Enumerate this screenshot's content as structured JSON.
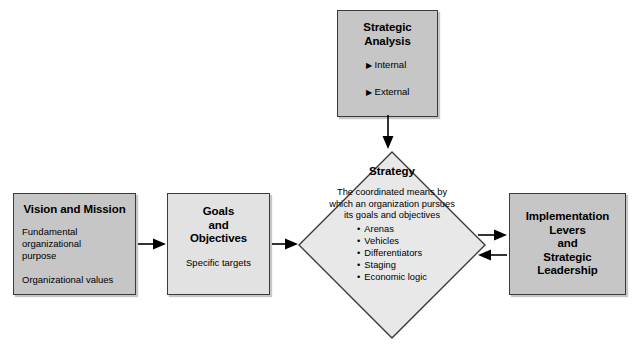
{
  "diagram": {
    "colors": {
      "box_dark": "#c6c6c6",
      "box_light": "#e2e2e2",
      "diamond_fill": "#e8e8e8",
      "border": "#3a3a3a",
      "text": "#000000",
      "background": "#ffffff"
    },
    "nodes": {
      "strategic_analysis": {
        "title_line1": "Strategic",
        "title_line2": "Analysis",
        "bullets": [
          "Internal",
          "External"
        ],
        "bullet_marker": "triangle-right-icon"
      },
      "vision_mission": {
        "title": "Vision and Mission",
        "line1": "Fundamental",
        "line2": "organizational",
        "line3": "purpose",
        "line4": "Organizational values"
      },
      "goals_objectives": {
        "title_line1": "Goals",
        "title_line2": "and",
        "title_line3": "Objectives",
        "subtitle": "Specific targets"
      },
      "strategy": {
        "title": "Strategy",
        "desc_line1": "The coordinated means by",
        "desc_line2": "which an organization pursues",
        "desc_line3": "its goals and objectives",
        "items": [
          "Arenas",
          "Vehicles",
          "Differentiators",
          "Staging",
          "Economic logic"
        ]
      },
      "implementation": {
        "line1": "Implementation",
        "line2": "Levers",
        "line3": "and",
        "line4": "Strategic",
        "line5": "Leadership"
      }
    },
    "connectors": [
      {
        "name": "analysis-to-strategy",
        "direction": "down"
      },
      {
        "name": "vision-to-goals",
        "direction": "right"
      },
      {
        "name": "goals-to-strategy",
        "direction": "right"
      },
      {
        "name": "strategy-to-implementation",
        "direction": "right"
      },
      {
        "name": "implementation-to-strategy",
        "direction": "left"
      }
    ]
  }
}
